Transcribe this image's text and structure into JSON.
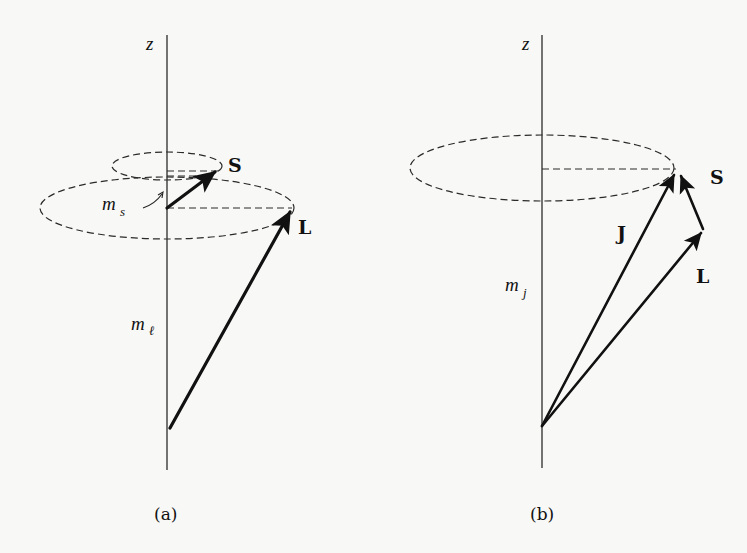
{
  "figure": {
    "background": "#f8f8f6",
    "ink_color": "#111111",
    "panels": [
      {
        "id": "a",
        "caption": "(a)",
        "axis_label": "z",
        "vectors": [
          {
            "name": "S",
            "label": "S"
          },
          {
            "name": "L",
            "label": "L"
          }
        ],
        "projections": [
          {
            "symbol": "m",
            "subscript": "s"
          },
          {
            "symbol": "m",
            "subscript": "ℓ"
          }
        ],
        "cones": [
          "S precession cone",
          "L precession cone"
        ]
      },
      {
        "id": "b",
        "caption": "(b)",
        "axis_label": "z",
        "vectors": [
          {
            "name": "J",
            "label": "J"
          },
          {
            "name": "L",
            "label": "L"
          },
          {
            "name": "S",
            "label": "S"
          }
        ],
        "projections": [
          {
            "symbol": "m",
            "subscript": "j"
          }
        ],
        "cones": [
          "J precession cone"
        ]
      }
    ]
  }
}
